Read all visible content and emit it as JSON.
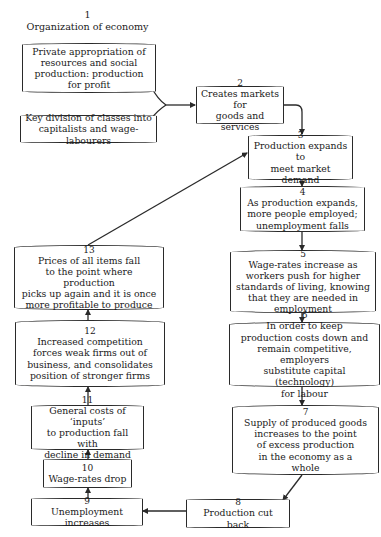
{
  "diagram": {
    "title": {
      "number": "1",
      "label": "Organization of economy"
    },
    "nodes": [
      {
        "id": "1a",
        "number": "",
        "text": "Private appropriation of\nresources and social\nproduction: production\nfor profit"
      },
      {
        "id": "1b",
        "number": "",
        "text": "Key division of classes into\ncapitalists and wage-labourers"
      },
      {
        "id": "2",
        "number": "2",
        "text": "Creates markets for\ngoods and services"
      },
      {
        "id": "3",
        "number": "3",
        "text": "Production expands to\nmeet market demand"
      },
      {
        "id": "4",
        "number": "4",
        "text": "As production expands,\nmore people employed;\nunemployment falls"
      },
      {
        "id": "5",
        "number": "5",
        "text": "Wage-rates increase as\nworkers push for higher\nstandards of living, knowing\nthat they are needed in\nemployment"
      },
      {
        "id": "6",
        "number": "6",
        "text": "In order to keep\nproduction costs down and\nremain competitive, employers\nsubstitute capital (technology)\nfor labour"
      },
      {
        "id": "7",
        "number": "7",
        "text": "Supply of produced goods\nincreases to the point\nof excess production\nin the economy as a\nwhole"
      },
      {
        "id": "8",
        "number": "8",
        "text": "Production cut back"
      },
      {
        "id": "9",
        "number": "9",
        "text": "Unemployment increases"
      },
      {
        "id": "10",
        "number": "10",
        "text": "Wage-rates drop"
      },
      {
        "id": "11",
        "number": "11",
        "text": "General costs of ‘inputs’\nto production fall with\ndecline in demand"
      },
      {
        "id": "12",
        "number": "12",
        "text": "Increased competition\nforces weak firms out of\nbusiness, and consolidates\nposition of stronger firms"
      },
      {
        "id": "13",
        "number": "13",
        "text": "Prices of all items fall\nto the point where production\npicks up again and it is once\nmore profitable to produce"
      }
    ],
    "edges": [
      [
        "1a",
        "2"
      ],
      [
        "1b",
        "2"
      ],
      [
        "2",
        "3"
      ],
      [
        "3",
        "4"
      ],
      [
        "4",
        "5"
      ],
      [
        "5",
        "6"
      ],
      [
        "6",
        "7"
      ],
      [
        "7",
        "8"
      ],
      [
        "8",
        "9"
      ],
      [
        "9",
        "10"
      ],
      [
        "10",
        "11"
      ],
      [
        "11",
        "12"
      ],
      [
        "12",
        "13"
      ],
      [
        "13",
        "3"
      ]
    ],
    "line_color": "#2a2a2a"
  }
}
